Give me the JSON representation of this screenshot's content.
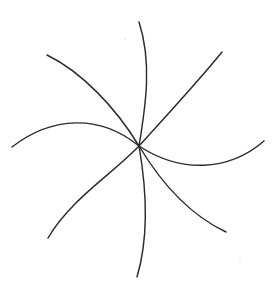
{
  "figure": {
    "caption": "",
    "background_color": "#ffffff",
    "stroke_color": "#2b2b2b",
    "stroke_width": 1.45,
    "canvas": {
      "width": 272,
      "height": 288
    },
    "center": {
      "x": 139,
      "y": 146
    },
    "arm_count": 7,
    "handedness": "clockwise",
    "arms": [
      {
        "name": "arm-1-top",
        "tip": {
          "x": 139,
          "y": 22
        },
        "path": "M 139 146 C 146 104 152 62 139 22"
      },
      {
        "name": "arm-2-upper-right",
        "tip": {
          "x": 222,
          "y": 52
        },
        "path": "M 139 146 C 166 116 196 84 222 52"
      },
      {
        "name": "arm-3-right",
        "tip": {
          "x": 264,
          "y": 141
        },
        "path": "M 139 146 C 180 173 228 172 264 141"
      },
      {
        "name": "arm-4-lower-right",
        "tip": {
          "x": 226,
          "y": 232
        },
        "path": "M 139 146 C 163 186 192 216 226 232"
      },
      {
        "name": "arm-5-bottom",
        "tip": {
          "x": 137,
          "y": 277
        },
        "path": "M 139 146 C 147 192 148 240 137 277"
      },
      {
        "name": "arm-6-lower-left",
        "tip": {
          "x": 48,
          "y": 238
        },
        "path": "M 139 146 C 110 176 70 200 48 238"
      },
      {
        "name": "arm-7-left",
        "tip": {
          "x": 12,
          "y": 147
        },
        "path": "M 139 146 C 100 114 52 116 12 147"
      },
      {
        "name": "arm-8-upper-left",
        "tip": {
          "x": 47,
          "y": 55
        },
        "path": "M 139 146 C 116 108 82 72 47 55"
      }
    ],
    "specks": [
      {
        "name": "speck-upper-center",
        "x": 125,
        "y": 39,
        "r": 0.7
      },
      {
        "name": "speck-lower-right",
        "x": 240,
        "y": 262,
        "r": 0.7
      }
    ]
  }
}
